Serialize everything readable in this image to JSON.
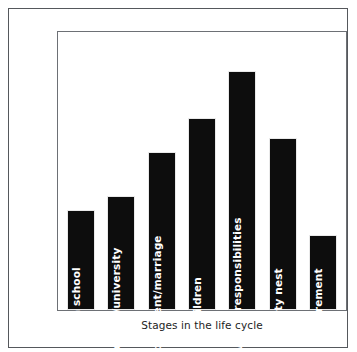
{
  "chart_data": {
    "type": "bar",
    "title": "",
    "xlabel": "Stages in the life cycle",
    "ylabel": "Relative Intensity of time constraints",
    "categories": [
      "High school",
      "College/university",
      "Employment/marriage",
      "Children",
      "Family/work responsibilities",
      "Empty nest",
      "Retirement"
    ],
    "values": [
      36,
      41,
      57,
      69,
      86,
      62,
      27
    ],
    "ylim": [
      0,
      100
    ],
    "grid": false,
    "legend": null,
    "tick_labels": {
      "x": [
        "High school",
        "College/university",
        "Employment/marriage",
        "Children",
        "Family/work responsibilities",
        "Empty nest",
        "Retirement"
      ],
      "y": []
    },
    "bar_color": "#0d0d0d",
    "bar_label_color": "#ffffff",
    "plot_border_color": "#6d7075",
    "figure_border_color": "#55585c",
    "background_color": "#ffffff"
  },
  "figure": {
    "y_axis_title": "Relative Intensity of time constraints",
    "x_axis_title": "Stages in the life cycle"
  }
}
